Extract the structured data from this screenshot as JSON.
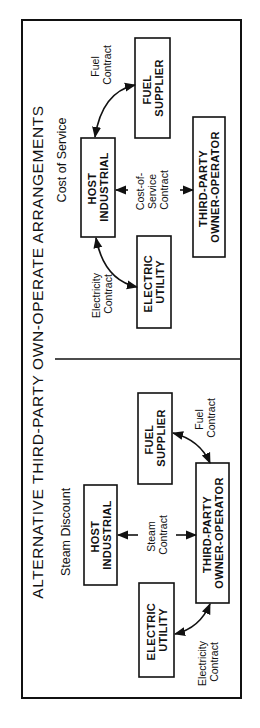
{
  "title": "ALTERNATIVE THIRD-PARTY OWN-OPERATE ARRANGEMENTS",
  "orientation": "rotated 90 degrees counter-clockwise",
  "panels": [
    {
      "id": "steam-discount",
      "heading": "Steam Discount",
      "nodes": {
        "host": [
          "HOST",
          "INDUSTRIAL"
        ],
        "utility": [
          "ELECTRIC",
          "UTILITY"
        ],
        "fuel": [
          "FUEL",
          "SUPPLIER"
        ],
        "operator": [
          "THIRD-PARTY",
          "OWNER-OPERATOR"
        ]
      },
      "edges": {
        "steam": [
          "Steam",
          "Contract"
        ],
        "electricity": [
          "Electricity",
          "Contract"
        ],
        "fuel": [
          "Fuel",
          "Contract"
        ]
      }
    },
    {
      "id": "cost-of-service",
      "heading": "Cost of Service",
      "nodes": {
        "host": [
          "HOST",
          "INDUSTRIAL"
        ],
        "utility": [
          "ELECTRIC",
          "UTILITY"
        ],
        "fuel": [
          "FUEL",
          "SUPPLIER"
        ],
        "operator": [
          "THIRD-PARTY",
          "OWNER-OPERATOR"
        ]
      },
      "edges": {
        "service": [
          "Cost-of-",
          "Service",
          "Contract"
        ],
        "electricity": [
          "Electricity",
          "Contract"
        ],
        "fuel": [
          "Fuel",
          "Contract"
        ]
      }
    }
  ]
}
